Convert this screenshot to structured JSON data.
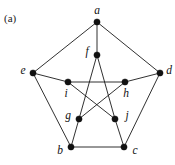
{
  "figure": {
    "caption": "(a)",
    "cut_off_header": "",
    "background_color": "#ffffff",
    "line_color": "#1a1a1a",
    "vertex_color": "#111111",
    "width": 175,
    "height": 165
  },
  "graph": {
    "name": "Petersen graph",
    "vertex_count": 10,
    "edge_count": 15,
    "vertex_radius": 3.1,
    "vertices": [
      {
        "id": "a",
        "label": "a",
        "x": 97,
        "y": 22,
        "label_x": 97,
        "label_y": 11,
        "group": "outer"
      },
      {
        "id": "b",
        "label": "b",
        "x": 71,
        "y": 147,
        "label_x": 60,
        "label_y": 151,
        "group": "outer"
      },
      {
        "id": "c",
        "label": "c",
        "x": 124,
        "y": 147,
        "label_x": 135,
        "label_y": 151,
        "group": "outer"
      },
      {
        "id": "d",
        "label": "d",
        "x": 160,
        "y": 73,
        "label_x": 169,
        "label_y": 71,
        "group": "outer"
      },
      {
        "id": "e",
        "label": "e",
        "x": 33,
        "y": 73,
        "label_x": 23,
        "label_y": 71,
        "group": "outer"
      },
      {
        "id": "f",
        "label": "f",
        "x": 97,
        "y": 55,
        "label_x": 87,
        "label_y": 52,
        "group": "inner"
      },
      {
        "id": "g",
        "label": "g",
        "x": 79,
        "y": 119,
        "label_x": 68,
        "label_y": 116,
        "group": "inner"
      },
      {
        "id": "h",
        "label": "h",
        "x": 125,
        "y": 82,
        "label_x": 126,
        "label_y": 94,
        "group": "inner"
      },
      {
        "id": "i",
        "label": "i",
        "x": 68,
        "y": 82,
        "label_x": 66,
        "label_y": 94,
        "group": "inner"
      },
      {
        "id": "j",
        "label": "j",
        "x": 115,
        "y": 119,
        "label_x": 127,
        "label_y": 116,
        "group": "inner"
      }
    ],
    "edges": [
      {
        "from": "a",
        "to": "e",
        "kind": "outer-cycle"
      },
      {
        "from": "a",
        "to": "d",
        "kind": "outer-cycle"
      },
      {
        "from": "e",
        "to": "b",
        "kind": "outer-cycle"
      },
      {
        "from": "d",
        "to": "c",
        "kind": "outer-cycle"
      },
      {
        "from": "b",
        "to": "c",
        "kind": "outer-cycle"
      },
      {
        "from": "a",
        "to": "f",
        "kind": "spoke"
      },
      {
        "from": "e",
        "to": "i",
        "kind": "spoke"
      },
      {
        "from": "d",
        "to": "h",
        "kind": "spoke"
      },
      {
        "from": "b",
        "to": "g",
        "kind": "spoke"
      },
      {
        "from": "c",
        "to": "j",
        "kind": "spoke"
      },
      {
        "from": "f",
        "to": "g",
        "kind": "inner-pentagram"
      },
      {
        "from": "f",
        "to": "j",
        "kind": "inner-pentagram"
      },
      {
        "from": "i",
        "to": "h",
        "kind": "inner-pentagram"
      },
      {
        "from": "i",
        "to": "j",
        "kind": "inner-pentagram"
      },
      {
        "from": "g",
        "to": "h",
        "kind": "inner-pentagram"
      }
    ]
  }
}
